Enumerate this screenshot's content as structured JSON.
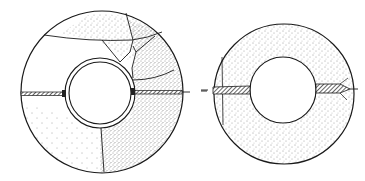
{
  "figure": {
    "left_ring": {
      "label": "Cracked insulation ring with jacketed pipe",
      "outer": {
        "cx": 102,
        "cy": 92,
        "r": 81
      },
      "inner_outer": {
        "cx": 100,
        "cy": 93,
        "r": 35
      },
      "inner_inner": {
        "cx": 100,
        "cy": 93,
        "r": 31
      }
    },
    "right_ring": {
      "label": "Intact insulation ring",
      "outer": {
        "cx": 284,
        "cy": 94,
        "r": 70
      },
      "inner": {
        "cx": 283,
        "cy": 90,
        "r": 33
      }
    },
    "colors": {
      "line": "#1a1a1a",
      "stipple": "#3a3a3a",
      "background": "#ffffff",
      "hatch": "#222222"
    }
  }
}
